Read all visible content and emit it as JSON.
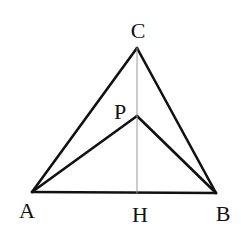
{
  "diagram": {
    "type": "geometry-triangle",
    "colors": {
      "stroke": "#111111",
      "thin_stroke": "#999999",
      "background": "#ffffff"
    },
    "points": {
      "A": {
        "label": "A",
        "x": 32,
        "y": 192,
        "lx": 27,
        "ly": 218
      },
      "B": {
        "label": "B",
        "x": 216,
        "y": 193,
        "lx": 223,
        "ly": 221
      },
      "C": {
        "label": "C",
        "x": 137,
        "y": 48,
        "lx": 138,
        "ly": 38
      },
      "P": {
        "label": "P",
        "x": 137,
        "y": 116,
        "lx": 120,
        "ly": 119
      },
      "H": {
        "label": "H",
        "x": 137,
        "y": 193,
        "lx": 140,
        "ly": 222
      }
    },
    "segments": [
      {
        "from": "A",
        "to": "B",
        "style": "thick"
      },
      {
        "from": "A",
        "to": "C",
        "style": "thick"
      },
      {
        "from": "B",
        "to": "C",
        "style": "thick"
      },
      {
        "from": "A",
        "to": "P",
        "style": "thick"
      },
      {
        "from": "B",
        "to": "P",
        "style": "thick"
      },
      {
        "from": "C",
        "to": "H",
        "style": "thin"
      }
    ]
  }
}
